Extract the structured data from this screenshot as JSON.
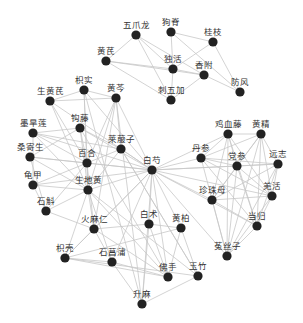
{
  "title": "",
  "colors": {
    "node": "#222222",
    "edge": "#c8c8c8",
    "label": "#333333"
  },
  "nodes": [
    {
      "id": "wuzhualong",
      "label": "五爪龙"
    },
    {
      "id": "gouji",
      "label": "狗脊"
    },
    {
      "id": "guizhi",
      "label": "桂枝"
    },
    {
      "id": "huangqi",
      "label": "黄芪"
    },
    {
      "id": "duhuo",
      "label": "独活"
    },
    {
      "id": "xiangfu",
      "label": "香附"
    },
    {
      "id": "fangfeng",
      "label": "防风"
    },
    {
      "id": "ciwujia",
      "label": "刺五加"
    },
    {
      "id": "zhishi",
      "label": "枳实"
    },
    {
      "id": "huangqin",
      "label": "黄芩"
    },
    {
      "id": "shenghuangqi",
      "label": "生黄芪"
    },
    {
      "id": "gouteng",
      "label": "钩藤"
    },
    {
      "id": "mohanlian",
      "label": "墨旱莲"
    },
    {
      "id": "laifuzi",
      "label": "莱菔子"
    },
    {
      "id": "sangjisheng",
      "label": "桑寄生"
    },
    {
      "id": "baihe",
      "label": "百合"
    },
    {
      "id": "baishao",
      "label": "白芍"
    },
    {
      "id": "guijia",
      "label": "龟甲"
    },
    {
      "id": "shengdihuang",
      "label": "生地黄"
    },
    {
      "id": "shihu",
      "label": "石斛"
    },
    {
      "id": "jixueteng",
      "label": "鸡血藤"
    },
    {
      "id": "huangjing",
      "label": "黄精"
    },
    {
      "id": "danshen",
      "label": "丹参"
    },
    {
      "id": "dangshen",
      "label": "党参"
    },
    {
      "id": "yuanzhi",
      "label": "远志"
    },
    {
      "id": "zhenzhumu",
      "label": "珍珠母"
    },
    {
      "id": "qianghuo",
      "label": "羌活"
    },
    {
      "id": "danggui",
      "label": "当归"
    },
    {
      "id": "tusizi",
      "label": "菟丝子"
    },
    {
      "id": "huomaren",
      "label": "火麻仁"
    },
    {
      "id": "baizhu",
      "label": "白术"
    },
    {
      "id": "huangbai",
      "label": "黄柏"
    },
    {
      "id": "zhiqiao",
      "label": "枳壳"
    },
    {
      "id": "shichangpu",
      "label": "石菖蒲"
    },
    {
      "id": "foshou",
      "label": "佛手"
    },
    {
      "id": "yuzhu",
      "label": "玉竹"
    },
    {
      "id": "shengma",
      "label": "升麻"
    }
  ],
  "edges": [
    [
      "wuzhualong",
      "huangqi"
    ],
    [
      "wuzhualong",
      "duhuo"
    ],
    [
      "wuzhualong",
      "xiangfu"
    ],
    [
      "wuzhualong",
      "ciwujia"
    ],
    [
      "gouji",
      "guizhi"
    ],
    [
      "gouji",
      "duhuo"
    ],
    [
      "gouji",
      "fangfeng"
    ],
    [
      "guizhi",
      "duhuo"
    ],
    [
      "guizhi",
      "fangfeng"
    ],
    [
      "huangqi",
      "duhuo"
    ],
    [
      "huangqi",
      "xiangfu"
    ],
    [
      "huangqi",
      "ciwujia"
    ],
    [
      "duhuo",
      "ciwujia"
    ],
    [
      "duhuo",
      "xiangfu"
    ],
    [
      "xiangfu",
      "fangfeng"
    ],
    [
      "xiangfu",
      "ciwujia"
    ],
    [
      "zhishi",
      "shenghuangqi"
    ],
    [
      "zhishi",
      "huangqin"
    ],
    [
      "zhishi",
      "baihe"
    ],
    [
      "zhishi",
      "baishao"
    ],
    [
      "zhishi",
      "shengdihuang"
    ],
    [
      "huangqin",
      "shenghuangqi"
    ],
    [
      "huangqin",
      "baihe"
    ],
    [
      "huangqin",
      "shengdihuang"
    ],
    [
      "huangqin",
      "huomaren"
    ],
    [
      "huangqin",
      "laifuzi"
    ],
    [
      "huangqin",
      "baishao"
    ],
    [
      "shenghuangqi",
      "baishao"
    ],
    [
      "shenghuangqi",
      "shengdihuang"
    ],
    [
      "shenghuangqi",
      "baihe"
    ],
    [
      "gouteng",
      "mohanlian"
    ],
    [
      "gouteng",
      "baishao"
    ],
    [
      "gouteng",
      "baihe"
    ],
    [
      "gouteng",
      "sangjisheng"
    ],
    [
      "gouteng",
      "shengdihuang"
    ],
    [
      "gouteng",
      "laifuzi"
    ],
    [
      "mohanlian",
      "baishao"
    ],
    [
      "mohanlian",
      "baihe"
    ],
    [
      "mohanlian",
      "shengdihuang"
    ],
    [
      "mohanlian",
      "guijia"
    ],
    [
      "mohanlian",
      "laifuzi"
    ],
    [
      "laifuzi",
      "baishao"
    ],
    [
      "laifuzi",
      "baihe"
    ],
    [
      "laifuzi",
      "shengdihuang"
    ],
    [
      "sangjisheng",
      "baihe"
    ],
    [
      "sangjisheng",
      "baishao"
    ],
    [
      "sangjisheng",
      "shengdihuang"
    ],
    [
      "sangjisheng",
      "shihu"
    ],
    [
      "baihe",
      "baishao"
    ],
    [
      "baihe",
      "shengdihuang"
    ],
    [
      "baihe",
      "guijia"
    ],
    [
      "baihe",
      "shihu"
    ],
    [
      "baihe",
      "huomaren"
    ],
    [
      "guijia",
      "baishao"
    ],
    [
      "guijia",
      "shengdihuang"
    ],
    [
      "guijia",
      "shihu"
    ],
    [
      "shengdihuang",
      "baishao"
    ],
    [
      "shengdihuang",
      "shihu"
    ],
    [
      "shengdihuang",
      "huomaren"
    ],
    [
      "shengdihuang",
      "zhiqiao"
    ],
    [
      "shengdihuang",
      "shichangpu"
    ],
    [
      "shengdihuang",
      "foshou"
    ],
    [
      "shengdihuang",
      "yuzhu"
    ],
    [
      "baishao",
      "danshen"
    ],
    [
      "baishao",
      "dangshen"
    ],
    [
      "baishao",
      "jixueteng"
    ],
    [
      "baishao",
      "yuanzhi"
    ],
    [
      "baishao",
      "zhenzhumu"
    ],
    [
      "baishao",
      "qianghuo"
    ],
    [
      "baishao",
      "danggui"
    ],
    [
      "baishao",
      "tusizi"
    ],
    [
      "baishao",
      "baizhu"
    ],
    [
      "baishao",
      "huangbai"
    ],
    [
      "baishao",
      "huomaren"
    ],
    [
      "baishao",
      "shichangpu"
    ],
    [
      "baishao",
      "zhiqiao"
    ],
    [
      "baishao",
      "foshou"
    ],
    [
      "baishao",
      "shengma"
    ],
    [
      "jixueteng",
      "huangjing"
    ],
    [
      "jixueteng",
      "danshen"
    ],
    [
      "jixueteng",
      "dangshen"
    ],
    [
      "jixueteng",
      "qianghuo"
    ],
    [
      "jixueteng",
      "danggui"
    ],
    [
      "jixueteng",
      "tusizi"
    ],
    [
      "jixueteng",
      "zhenzhumu"
    ],
    [
      "huangjing",
      "danshen"
    ],
    [
      "huangjing",
      "dangshen"
    ],
    [
      "huangjing",
      "yuanzhi"
    ],
    [
      "huangjing",
      "qianghuo"
    ],
    [
      "huangjing",
      "danggui"
    ],
    [
      "huangjing",
      "tusizi"
    ],
    [
      "huangjing",
      "zhenzhumu"
    ],
    [
      "danshen",
      "dangshen"
    ],
    [
      "danshen",
      "yuanzhi"
    ],
    [
      "danshen",
      "qianghuo"
    ],
    [
      "danshen",
      "tusizi"
    ],
    [
      "danshen",
      "danggui"
    ],
    [
      "dangshen",
      "yuanzhi"
    ],
    [
      "dangshen",
      "qianghuo"
    ],
    [
      "dangshen",
      "danggui"
    ],
    [
      "dangshen",
      "tusizi"
    ],
    [
      "dangshen",
      "zhenzhumu"
    ],
    [
      "yuanzhi",
      "qianghuo"
    ],
    [
      "yuanzhi",
      "danggui"
    ],
    [
      "yuanzhi",
      "zhenzhumu"
    ],
    [
      "yuanzhi",
      "tusizi"
    ],
    [
      "zhenzhumu",
      "danggui"
    ],
    [
      "zhenzhumu",
      "tusizi"
    ],
    [
      "zhenzhumu",
      "qianghuo"
    ],
    [
      "qianghuo",
      "danggui"
    ],
    [
      "qianghuo",
      "tusizi"
    ],
    [
      "danggui",
      "tusizi"
    ],
    [
      "huomaren",
      "baizhu"
    ],
    [
      "huomaren",
      "zhiqiao"
    ],
    [
      "huomaren",
      "shichangpu"
    ],
    [
      "huomaren",
      "foshou"
    ],
    [
      "baizhu",
      "huangbai"
    ],
    [
      "baizhu",
      "shengma"
    ],
    [
      "baizhu",
      "foshou"
    ],
    [
      "huangbai",
      "zhiqiao"
    ],
    [
      "huangbai",
      "yuzhu"
    ],
    [
      "huangbai",
      "foshou"
    ],
    [
      "zhiqiao",
      "shichangpu"
    ],
    [
      "zhiqiao",
      "foshou"
    ],
    [
      "zhiqiao",
      "yuzhu"
    ],
    [
      "shichangpu",
      "foshou"
    ],
    [
      "shichangpu",
      "shengma"
    ],
    [
      "yuzhu",
      "shengma"
    ],
    [
      "yuzhu",
      "laifuzi"
    ],
    [
      "shihu",
      "huomaren"
    ],
    [
      "zhishi",
      "shengma"
    ],
    [
      "huangqin",
      "shengma"
    ],
    [
      "laifuzi",
      "yuzhu"
    ],
    [
      "gouteng",
      "foshou"
    ]
  ]
}
